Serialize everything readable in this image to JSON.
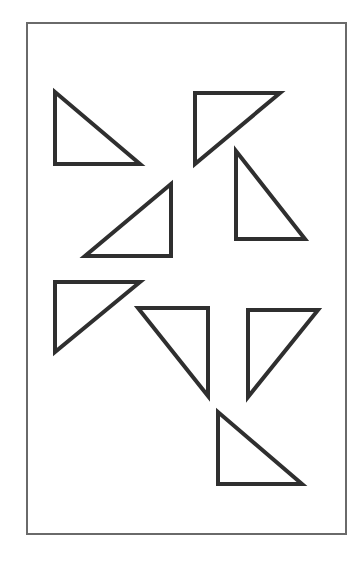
{
  "figure": {
    "stroke_color": "#2f2f2f",
    "frame_color": "#6a6a6a",
    "background_color": "#ffffff",
    "frame": {
      "x": 27,
      "y": 23,
      "width": 319,
      "height": 511
    },
    "triangles": [
      {
        "id": "t1",
        "orientation": "right-angle-bottom-left",
        "points": "55,92 55,164 140,164"
      },
      {
        "id": "t2",
        "orientation": "right-angle-top-left",
        "points": "195,93 280,93 195,164"
      },
      {
        "id": "t3",
        "orientation": "right-angle-bottom-left",
        "points": "236,151 236,239 305,239"
      },
      {
        "id": "t4",
        "orientation": "right-angle-bottom-right",
        "points": "171,184 85,256 171,256"
      },
      {
        "id": "t5",
        "orientation": "right-angle-top-left",
        "points": "55,282 140,282 55,352"
      },
      {
        "id": "t6",
        "orientation": "right-angle-top-right",
        "points": "138,308 208,308 208,396"
      },
      {
        "id": "t7",
        "orientation": "right-angle-top-left",
        "points": "248,310 318,310 248,397"
      },
      {
        "id": "t8",
        "orientation": "right-angle-bottom-left",
        "points": "218,412 218,484 302,484"
      }
    ]
  }
}
